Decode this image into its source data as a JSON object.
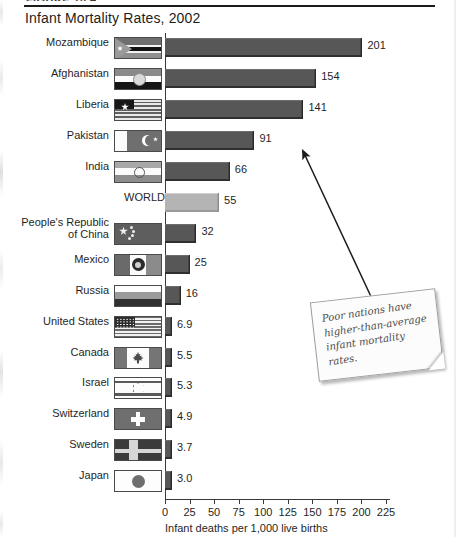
{
  "figure": {
    "tag": "FIGURE 10.4",
    "title": "Infant Mortality Rates, 2002"
  },
  "note": {
    "text": "Poor nations have higher-than-average infant mortality rates.",
    "arrow_label": "callout-arrow"
  },
  "chart_data": {
    "type": "bar",
    "title": "Infant Mortality Rates, 2002",
    "xlabel": "Infant deaths per 1,000 live births",
    "ylabel": "",
    "orientation": "horizontal",
    "xlim": [
      0,
      225
    ],
    "xticks": [
      0,
      25,
      50,
      75,
      100,
      125,
      150,
      175,
      200,
      225
    ],
    "xtick_labels": [
      "0",
      "25",
      "50",
      "75",
      "100",
      "125",
      "150",
      "175",
      "200",
      "225"
    ],
    "grid": false,
    "legend": "none",
    "highlight_category": "WORLD",
    "bar_color": "#575757",
    "highlight_color": "#b4b4b4",
    "categories": [
      "Mozambique",
      "Afghanistan",
      "Liberia",
      "Pakistan",
      "India",
      "WORLD",
      "People's Republic\nof China",
      "Mexico",
      "Russia",
      "United States",
      "Canada",
      "Israel",
      "Switzerland",
      "Sweden",
      "Japan"
    ],
    "values": [
      201,
      154,
      141,
      91,
      66,
      55,
      32,
      25,
      16,
      6.9,
      5.5,
      5.3,
      4.9,
      3.7,
      3.0
    ],
    "value_labels": [
      "201",
      "154",
      "141",
      "91",
      "66",
      "55",
      "32",
      "25",
      "16",
      "6.9",
      "5.5",
      "5.3",
      "4.9",
      "3.7",
      "3.0"
    ]
  }
}
